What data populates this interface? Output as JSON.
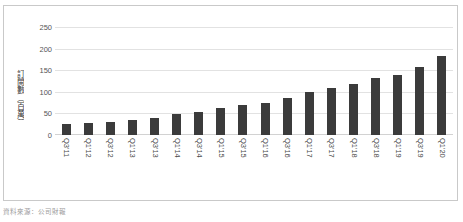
{
  "chart_data": {
    "type": "bar",
    "title": "",
    "subtitle": "",
    "xlabel": "",
    "ylabel": "訂閱數（百萬）",
    "ylim": [
      0,
      250
    ],
    "ytick_labels": [
      "250",
      "200",
      "150",
      "100",
      "50",
      "0"
    ],
    "ytick_values": [
      250,
      200,
      150,
      100,
      50,
      0
    ],
    "grid": true,
    "legend": null,
    "bar_color": "#3b3b3b",
    "categories": [
      "Q3'11",
      "Q1'12",
      "Q3'12",
      "Q1'13",
      "Q3'13",
      "Q1'14",
      "Q3'14",
      "Q1'15",
      "Q3'15",
      "Q1'16",
      "Q3'16",
      "Q1'17",
      "Q3'17",
      "Q1'18",
      "Q3'18",
      "Q1'19",
      "Q3'19",
      "Q1'20"
    ],
    "values": [
      25,
      27,
      30,
      34,
      40,
      48,
      54,
      62,
      69,
      75,
      86,
      99,
      109,
      119,
      131,
      139,
      158,
      183
    ]
  },
  "caption": {
    "text": "資料來源：公司財報"
  }
}
